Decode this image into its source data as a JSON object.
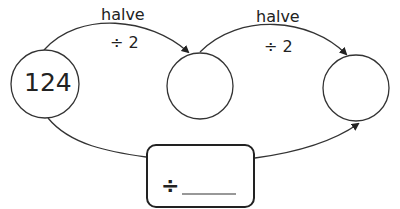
{
  "diagram": {
    "start_value": "124",
    "arrows": [
      {
        "label_top": "halve",
        "label_bottom": "÷ 2"
      },
      {
        "label_top": "halve",
        "label_bottom": "÷ 2"
      }
    ],
    "circles": [
      {
        "value": "124"
      },
      {
        "value": ""
      },
      {
        "value": ""
      }
    ],
    "combined_box": {
      "operator": "÷",
      "blank": ""
    }
  }
}
